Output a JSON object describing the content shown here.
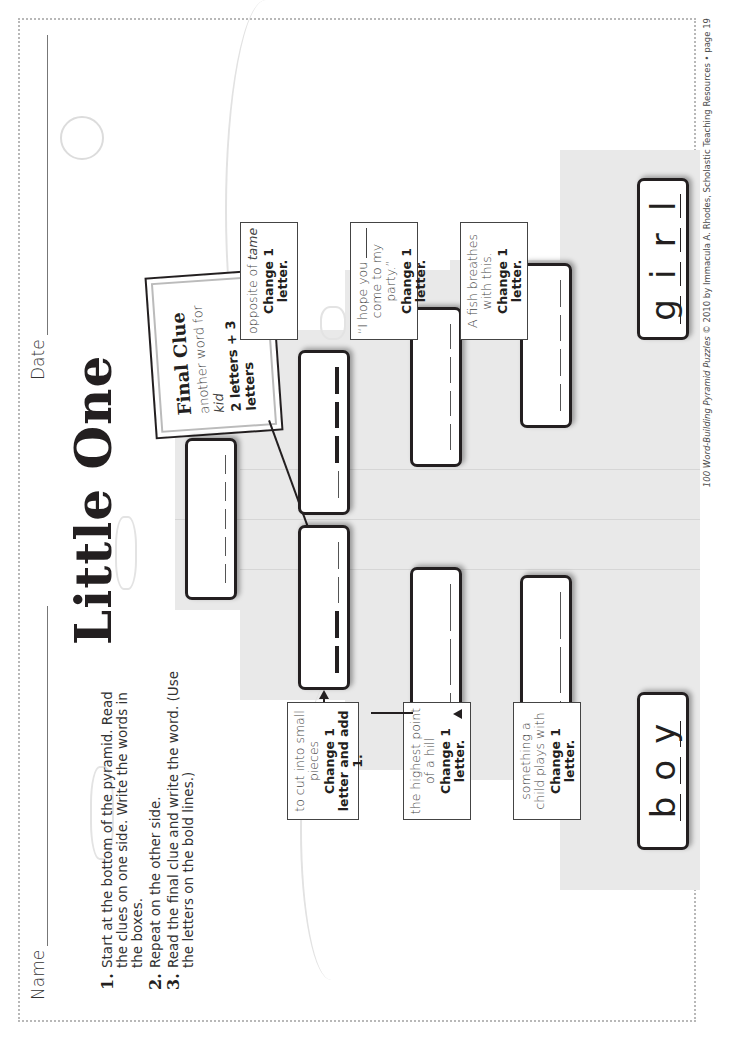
{
  "header": {
    "name_label": "Name",
    "date_label": "Date",
    "title": "Little One"
  },
  "instructions": [
    {
      "num": "1.",
      "text": "Start at the bottom of the pyramid. Read the clues on one side. Write the words in the boxes."
    },
    {
      "num": "2.",
      "text": "Repeat on the other side."
    },
    {
      "num": "3.",
      "text": "Read the final clue and write the word. (Use the letters on the bold lines.)"
    }
  ],
  "final_clue": {
    "title": "Final Clue",
    "text_prefix": "another word for ",
    "text_emphasis": "kid",
    "rule": "2 letters + 3 letters",
    "blanks": 5
  },
  "left_side": {
    "start_word": {
      "letters": [
        "b",
        "o",
        "y"
      ]
    },
    "clues": [
      {
        "text": "something a child plays with",
        "rule": "Change 1 letter.",
        "blanks": 3,
        "bold": []
      },
      {
        "text": "the highest point of a hill",
        "rule": "Change 1 letter.",
        "blanks": 3,
        "bold": []
      },
      {
        "text": "to cut into small pieces",
        "rule": "Change 1 letter and add 1.",
        "blanks": 4,
        "bold": [
          0,
          1
        ]
      }
    ]
  },
  "right_side": {
    "start_word": {
      "letters": [
        "g",
        "i",
        "r",
        "l"
      ]
    },
    "clues": [
      {
        "text": "A fish breathes with this.",
        "rule": "Change 1 letter.",
        "blanks": 4,
        "bold": []
      },
      {
        "text": "“I hope you ____ come to my party.”",
        "text_a": "“I hope you",
        "text_b": "come to my party.”",
        "rule": "Change 1 letter.",
        "blanks": 4,
        "bold": []
      },
      {
        "text": "opposite of tame",
        "text_a": "opposite of ",
        "text_em": "tame",
        "rule": "Change 1 letter.",
        "blanks": 4,
        "bold": [
          1,
          2,
          3
        ]
      }
    ]
  },
  "footer": {
    "book": "100 Word-Building Pyramid Puzzles",
    "credit": " © 2010 by Immacula A. Rhodes, Scholastic Teaching Resources • page 19"
  }
}
